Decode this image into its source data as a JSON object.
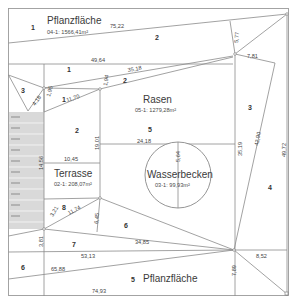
{
  "diagram": {
    "areas": [
      {
        "name": "Pflanzfläche",
        "code": "04-1: 1566,41m²"
      },
      {
        "name": "Rasen",
        "code": "05-1: 1279,28m²"
      },
      {
        "name": "Terrasse",
        "code": "02-1: 208,07m²"
      },
      {
        "name": "Wasserbecken",
        "code": "03-1: 99,93m²"
      },
      {
        "name": "Pflanzfläche",
        "code": ""
      }
    ],
    "triangle_numbers": {
      "t1_top": "1",
      "t2_top": "2",
      "t1_mid": "1",
      "t2_mid": "2",
      "t3_left": "3",
      "t1_small": "1",
      "t2_terrace": "2",
      "t5_rasen": "5",
      "t3_right": "3",
      "t4_right": "4",
      "t8": "8",
      "t6_mid": "6",
      "t7": "7",
      "t6_bottom": "6",
      "t5_bottom": "5"
    },
    "dimensions": {
      "d75_22": "75,22",
      "d49_64": "49,64",
      "d5_77": "5,77",
      "d7_81": "7,81",
      "d35_18": "35,18",
      "d1_94": "1,94",
      "d4_18": "4,18",
      "d1_95": "1,95",
      "d11_70": "11,70",
      "d19_01": "19,01",
      "d24_18": "24,18",
      "d5_64": "5,64",
      "d35_19": "35,19",
      "d42_90": "42,90",
      "d49_72": "49,72",
      "d10_45": "10,45",
      "d14_56": "14,56",
      "d3_21": "3,21",
      "d11_74": "11,74",
      "d6_45": "6,45",
      "d34_85": "34,85",
      "d3_81": "3,81",
      "d53_13": "53,13",
      "d65_88": "65,88",
      "d74_93": "74,93",
      "d7_89": "7,89",
      "d8_52": "8,52"
    }
  }
}
